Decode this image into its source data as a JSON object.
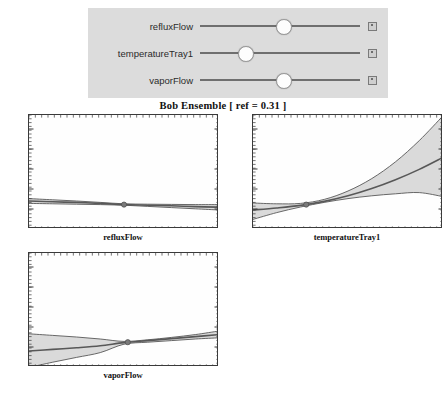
{
  "controls": {
    "panel_name": "slider-panel",
    "sliders": [
      {
        "label": "refluxFlow",
        "value_pct": 52,
        "stepper_icon": "stepper-square-icon"
      },
      {
        "label": "temperatureTray1",
        "value_pct": 28,
        "stepper_icon": "stepper-square-icon"
      },
      {
        "label": "vaporFlow",
        "value_pct": 52,
        "stepper_icon": "stepper-square-icon"
      }
    ]
  },
  "figure": {
    "title": "Bob Ensemble [ ref = 0.31 ]"
  },
  "chart_data": [
    {
      "type": "line",
      "title": "refluxFlow partial dependence",
      "xlabel": "refluxFlow",
      "ylabel": "",
      "ylim": [
        -1,
        4.7
      ],
      "xlim": [
        0,
        1
      ],
      "yticks": [
        -1,
        0,
        1,
        2,
        3,
        4
      ],
      "grid": false,
      "ref_point": {
        "x": 0.5,
        "y": 0.22
      },
      "series": [
        {
          "name": "mean",
          "x": [
            0,
            0.125,
            0.25,
            0.375,
            0.5,
            0.625,
            0.75,
            0.875,
            1
          ],
          "values": [
            0.4,
            0.36,
            0.33,
            0.28,
            0.22,
            0.19,
            0.16,
            0.12,
            0.09
          ]
        },
        {
          "name": "upper",
          "x": [
            0,
            0.125,
            0.25,
            0.375,
            0.5,
            0.625,
            0.75,
            0.875,
            1
          ],
          "values": [
            0.52,
            0.46,
            0.4,
            0.33,
            0.26,
            0.24,
            0.23,
            0.22,
            0.22
          ]
        },
        {
          "name": "lower",
          "x": [
            0,
            0.125,
            0.25,
            0.375,
            0.5,
            0.625,
            0.75,
            0.875,
            1
          ],
          "values": [
            0.28,
            0.26,
            0.24,
            0.22,
            0.19,
            0.13,
            0.07,
            0.01,
            -0.05
          ]
        }
      ]
    },
    {
      "type": "line",
      "title": "temperatureTray1 partial dependence",
      "xlabel": "temperatureTray1",
      "ylabel": "",
      "ylim": [
        -1,
        4.7
      ],
      "xlim": [
        0,
        1
      ],
      "yticks": [
        -1,
        0,
        1,
        2,
        3,
        4
      ],
      "grid": false,
      "ref_point": {
        "x": 0.28,
        "y": 0.22
      },
      "series": [
        {
          "name": "mean",
          "x": [
            0,
            0.125,
            0.25,
            0.375,
            0.5,
            0.625,
            0.75,
            0.875,
            1
          ],
          "values": [
            -0.05,
            0.05,
            0.18,
            0.38,
            0.66,
            1.02,
            1.46,
            1.98,
            2.58
          ]
        },
        {
          "name": "upper",
          "x": [
            0,
            0.125,
            0.25,
            0.375,
            0.5,
            0.625,
            0.75,
            0.875,
            1
          ],
          "values": [
            0.3,
            0.26,
            0.28,
            0.48,
            0.9,
            1.52,
            2.36,
            3.42,
            4.66
          ]
        },
        {
          "name": "lower",
          "x": [
            0,
            0.125,
            0.25,
            0.375,
            0.5,
            0.625,
            0.75,
            0.875,
            1
          ],
          "values": [
            -0.52,
            -0.18,
            0.1,
            0.33,
            0.52,
            0.66,
            0.76,
            0.82,
            0.62
          ]
        }
      ]
    },
    {
      "type": "line",
      "title": "vaporFlow partial dependence",
      "xlabel": "vaporFlow",
      "ylabel": "",
      "ylim": [
        -1,
        4.7
      ],
      "xlim": [
        0,
        1
      ],
      "yticks": [
        -1,
        0,
        1,
        2,
        3,
        4
      ],
      "grid": false,
      "ref_point": {
        "x": 0.52,
        "y": 0.24
      },
      "series": [
        {
          "name": "mean",
          "x": [
            0,
            0.125,
            0.25,
            0.375,
            0.5,
            0.625,
            0.75,
            0.875,
            1
          ],
          "values": [
            -0.2,
            -0.12,
            -0.04,
            0.06,
            0.22,
            0.32,
            0.42,
            0.52,
            0.62
          ]
        },
        {
          "name": "upper",
          "x": [
            0,
            0.125,
            0.25,
            0.375,
            0.5,
            0.625,
            0.75,
            0.875,
            1
          ],
          "values": [
            0.66,
            0.58,
            0.5,
            0.4,
            0.28,
            0.36,
            0.48,
            0.62,
            0.8
          ]
        },
        {
          "name": "lower",
          "x": [
            0,
            0.125,
            0.25,
            0.375,
            0.5,
            0.625,
            0.75,
            0.875,
            1
          ],
          "values": [
            -1.02,
            -0.76,
            -0.52,
            -0.28,
            0.14,
            0.24,
            0.32,
            0.4,
            0.46
          ]
        }
      ]
    }
  ],
  "style": {
    "band_fill": "#d4d4d4",
    "line_color": "#585858",
    "mean_color": "#6b6b6b",
    "frame_color": "#3a3a3a",
    "panel_bg": "#dcdcdc"
  }
}
